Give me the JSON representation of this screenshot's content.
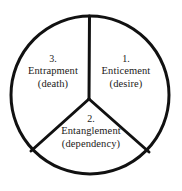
{
  "diagram": {
    "type": "three-sector-circle",
    "shape": "circle-divided-into-three-wedges",
    "stroke_color": "#111111",
    "background_color": "#ffffff",
    "text_color": "#1c1a18",
    "geometry": {
      "center_x": 90,
      "center_y": 95,
      "radius": 79,
      "hub_x": 89,
      "hub_y": 99,
      "stroke_width": 3,
      "spoke_angles_degrees": [
        90,
        210,
        330
      ]
    },
    "sectors": [
      {
        "position": "right",
        "index": "1.",
        "title": "Enticement",
        "note": "(desire)"
      },
      {
        "position": "bottom",
        "index": "2.",
        "title": "Entanglement",
        "note": "(dependency)"
      },
      {
        "position": "left",
        "index": "3.",
        "title": "Entrapment",
        "note": "(death)"
      }
    ]
  }
}
